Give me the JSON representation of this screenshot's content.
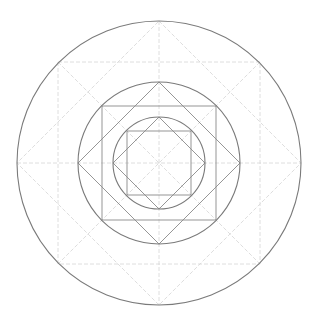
{
  "diagram": {
    "title": "",
    "center": [
      159,
      163
    ],
    "colors": {
      "heavy_stroke": "#7a7a7a",
      "mid_stroke": "#8a8a8a",
      "light_stroke": "#d6d6d6",
      "background": "#ffffff"
    },
    "circles": [
      {
        "name": "outer-circle",
        "r": 142
      },
      {
        "name": "middle-circle",
        "r": 81
      },
      {
        "name": "inner-circle",
        "r": 46
      }
    ],
    "squares": [
      {
        "name": "outer-square",
        "half": 101,
        "style": "light"
      },
      {
        "name": "middle-square",
        "half": 57,
        "style": "mid"
      },
      {
        "name": "inner-square",
        "half": 32,
        "style": "mid"
      }
    ],
    "diamonds": [
      {
        "name": "outer-diamond",
        "r": 142,
        "style": "light"
      },
      {
        "name": "middle-diamond",
        "r": 81,
        "style": "mid"
      },
      {
        "name": "inner-diamond",
        "r": 46,
        "style": "mid"
      }
    ],
    "guides": [
      "horizontal-axis",
      "vertical-axis",
      "diagonal-1",
      "diagonal-2"
    ]
  }
}
